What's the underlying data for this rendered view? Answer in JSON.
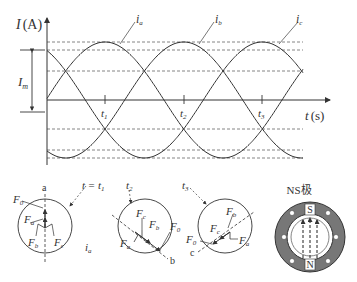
{
  "axes": {
    "y_label": "I",
    "y_unit": "(A)",
    "x_label": "t",
    "x_unit": "(s)",
    "amplitude_label": "I",
    "amplitude_sub": "m"
  },
  "curves": [
    {
      "name": "i",
      "sub": "a"
    },
    {
      "name": "i",
      "sub": "b"
    },
    {
      "name": "i",
      "sub": "c"
    }
  ],
  "ticks": [
    {
      "name": "t",
      "sub": "1"
    },
    {
      "name": "t",
      "sub": "2"
    },
    {
      "name": "t",
      "sub": "3"
    }
  ],
  "chart_data": {
    "type": "line",
    "title": "",
    "xlabel": "t (s)",
    "ylabel": "I (A)",
    "grid": "dashed horizontal at ±Im, ±0.866Im, ±0.5Im",
    "x_ticks": [
      "t1",
      "t2",
      "t3"
    ],
    "series": [
      {
        "name": "ia",
        "formula": "Im·cos(ω(t − t1))",
        "peak_at": "t1"
      },
      {
        "name": "ib",
        "formula": "Im·cos(ω(t − t2))",
        "peak_at": "t2"
      },
      {
        "name": "ic",
        "formula": "Im·cos(ω(t − t3))",
        "peak_at": "t3"
      }
    ],
    "phase_spacing_deg": 120
  },
  "circles": [
    {
      "time_label": "t = t",
      "time_sub": "1",
      "end_label": "a",
      "current_label": "i",
      "current_sub": "a",
      "forces": [
        {
          "F": "F",
          "s": "0"
        },
        {
          "F": "F",
          "s": "a"
        },
        {
          "F": "F",
          "s": "b"
        },
        {
          "F": "F",
          "s": "c"
        }
      ]
    },
    {
      "time_label": "t",
      "time_sub": "2",
      "end_label": "b",
      "forces": [
        {
          "F": "F",
          "s": "c"
        },
        {
          "F": "F",
          "s": "b"
        },
        {
          "F": "F",
          "s": "0"
        },
        {
          "F": "F",
          "s": "a"
        }
      ]
    },
    {
      "time_label": "t",
      "time_sub": "3",
      "end_label": "c",
      "forces": [
        {
          "F": "F",
          "s": "b"
        },
        {
          "F": "F",
          "s": "c"
        },
        {
          "F": "F",
          "s": "0"
        },
        {
          "F": "F",
          "s": "a"
        }
      ]
    }
  ],
  "magnet": {
    "title": "NS极",
    "north": "N",
    "south": "S"
  }
}
